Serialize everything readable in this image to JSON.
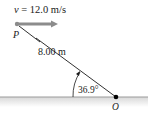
{
  "diagram": {
    "velocity_label": "v = 12.0 m/s",
    "velocity_symbol": "v",
    "velocity_value": " = 12.0 m/s",
    "point_p_label": "P",
    "distance_label": "8.00 m",
    "angle_label": "36.9°",
    "point_o_label": "O",
    "colors": {
      "arrow": "#8c8c8c",
      "line": "#1a1a1a",
      "ground": "#9a9a9a",
      "ground_fill": "#e4e4e4",
      "point": "#000000"
    }
  }
}
